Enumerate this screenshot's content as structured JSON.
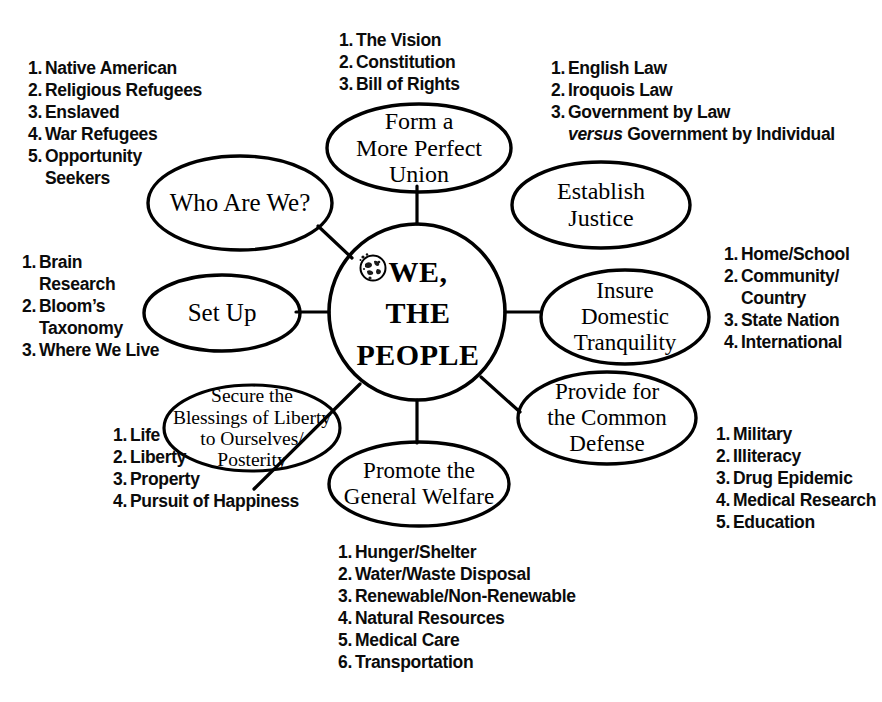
{
  "diagram": {
    "title": "WE, THE PEOPLE",
    "type": "concept-map",
    "ink_color": "#000000",
    "background": "#ffffff",
    "center": {
      "id": "we-the-people",
      "label_lines": [
        "WE,",
        "THE",
        "PEOPLE"
      ],
      "icon": "globe-icon"
    },
    "nodes": [
      {
        "id": "who-are-we",
        "label_lines": [
          "Who Are We?"
        ]
      },
      {
        "id": "form-a-more-perfect-union",
        "label_lines": [
          "Form a",
          "More Perfect",
          "Union"
        ]
      },
      {
        "id": "establish-justice",
        "label_lines": [
          "Establish",
          "Justice"
        ]
      },
      {
        "id": "set-up",
        "label_lines": [
          "Set Up"
        ]
      },
      {
        "id": "insure-domestic-tranquility",
        "label_lines": [
          "Insure",
          "Domestic",
          "Tranquility"
        ]
      },
      {
        "id": "secure-blessings-of-liberty",
        "label_lines": [
          "Secure the",
          "Blessings of Liberty",
          "to Ourselves/",
          "Posterity"
        ]
      },
      {
        "id": "provide-for-the-common-defense",
        "label_lines": [
          "Provide for",
          "the Common",
          "Defense"
        ]
      },
      {
        "id": "promote-the-general-welfare",
        "label_lines": [
          "Promote the",
          "General Welfare"
        ]
      }
    ],
    "lists": {
      "who_are_we": {
        "owner": "who-are-we",
        "items": [
          {
            "n": "1.",
            "text": "Native American"
          },
          {
            "n": "2.",
            "text": "Religious Refugees"
          },
          {
            "n": "3.",
            "text": "Enslaved"
          },
          {
            "n": "4.",
            "text": "War Refugees"
          },
          {
            "n": "5.",
            "text": "Opportunity",
            "cont": "Seekers"
          }
        ]
      },
      "form_union": {
        "owner": "form-a-more-perfect-union",
        "items": [
          {
            "n": "1.",
            "text": "The Vision"
          },
          {
            "n": "2.",
            "text": "Constitution"
          },
          {
            "n": "3.",
            "text": "Bill of Rights"
          }
        ]
      },
      "establish_justice": {
        "owner": "establish-justice",
        "items": [
          {
            "n": "1.",
            "text": "English Law"
          },
          {
            "n": "2.",
            "text": "Iroquois Law"
          },
          {
            "n": "3.",
            "text": "Government by Law",
            "cont_italic": "versus",
            "cont": " Government by Individual"
          }
        ]
      },
      "set_up": {
        "owner": "set-up",
        "items": [
          {
            "n": "1.",
            "text": "Brain",
            "cont": "Research"
          },
          {
            "n": "2.",
            "text": "Bloom’s",
            "cont": "Taxonomy"
          },
          {
            "n": "3.",
            "text": "Where We Live"
          }
        ]
      },
      "insure_tranquility": {
        "owner": "insure-domestic-tranquility",
        "items": [
          {
            "n": "1.",
            "text": "Home/School"
          },
          {
            "n": "2.",
            "text": "Community/",
            "cont": "Country"
          },
          {
            "n": "3.",
            "text": "State Nation"
          },
          {
            "n": "4.",
            "text": "International"
          }
        ]
      },
      "secure_blessings": {
        "owner": "secure-blessings-of-liberty",
        "items": [
          {
            "n": "1.",
            "text": "Life"
          },
          {
            "n": "2.",
            "text": "Liberty"
          },
          {
            "n": "3.",
            "text": "Property"
          },
          {
            "n": "4.",
            "text": "Pursuit of Happiness"
          }
        ]
      },
      "common_defense": {
        "owner": "provide-for-the-common-defense",
        "items": [
          {
            "n": "1.",
            "text": "Military"
          },
          {
            "n": "2.",
            "text": "Illiteracy"
          },
          {
            "n": "3.",
            "text": "Drug Epidemic"
          },
          {
            "n": "4.",
            "text": "Medical Research"
          },
          {
            "n": "5.",
            "text": "Education"
          }
        ]
      },
      "general_welfare": {
        "owner": "promote-the-general-welfare",
        "items": [
          {
            "n": "1.",
            "text": "Hunger/Shelter"
          },
          {
            "n": "2.",
            "text": "Water/Waste Disposal"
          },
          {
            "n": "3.",
            "text": "Renewable/Non-Renewable"
          },
          {
            "n": "4.",
            "text": "Natural Resources"
          },
          {
            "n": "5.",
            "text": "Medical Care"
          },
          {
            "n": "6.",
            "text": "Transportation"
          }
        ]
      }
    }
  }
}
